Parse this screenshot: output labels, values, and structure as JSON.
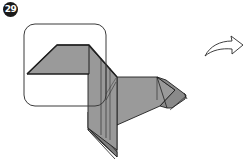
{
  "step": {
    "number": "29"
  },
  "diagram": {
    "highlight_box": "rounded-rect-focus-region",
    "action_arrow": "curved-arrow-right",
    "paper_color": "#9a9a9a",
    "paper_dark": "#7d7d7d",
    "line_color": "#1f1f1f",
    "box_color": "#3a3a3a"
  }
}
